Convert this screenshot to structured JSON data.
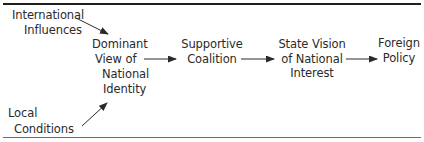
{
  "diagram": {
    "type": "flow",
    "nodes": [
      {
        "id": "international",
        "lines": [
          "International",
          "Influences"
        ]
      },
      {
        "id": "local",
        "lines": [
          "Local",
          "Conditions"
        ]
      },
      {
        "id": "dominant",
        "lines": [
          "Dominant",
          "View of",
          "National",
          "Identity"
        ]
      },
      {
        "id": "coalition",
        "lines": [
          "Supportive",
          "Coalition"
        ]
      },
      {
        "id": "vision",
        "lines": [
          "State Vision",
          "of National",
          "Interest"
        ]
      },
      {
        "id": "policy",
        "lines": [
          "Foreign",
          "Policy"
        ]
      }
    ],
    "edges": [
      {
        "from": "international",
        "to": "dominant"
      },
      {
        "from": "local",
        "to": "dominant"
      },
      {
        "from": "dominant",
        "to": "coalition"
      },
      {
        "from": "coalition",
        "to": "vision"
      },
      {
        "from": "vision",
        "to": "policy"
      }
    ],
    "colors": {
      "text": "#2a2a2a",
      "arrow": "#2a2a2a",
      "rule": "#1e1e1e"
    }
  }
}
